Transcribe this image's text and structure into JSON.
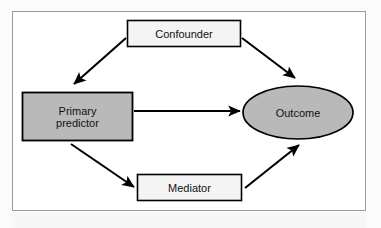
{
  "figure": {
    "type": "causal-path-diagram",
    "frame": {
      "border_color": "#9a9a9a",
      "background_color": "#ffffff"
    },
    "palette": {
      "shape_border": "#000000",
      "shaded_fill": "#b9b9b9",
      "plain_fill": "#f4f4f4",
      "arrow_color": "#000000",
      "text_color": "#111111"
    },
    "nodes": [
      {
        "id": "confounder",
        "label": "Confounder",
        "shape": "rectangle",
        "fill": "#f4f4f4"
      },
      {
        "id": "primary_predictor",
        "label": "Primary\npredictor",
        "shape": "rectangle",
        "fill": "#b9b9b9"
      },
      {
        "id": "outcome",
        "label": "Outcome",
        "shape": "ellipse",
        "fill": "#b9b9b9"
      },
      {
        "id": "mediator",
        "label": "Mediator",
        "shape": "rectangle",
        "fill": "#f4f4f4"
      }
    ],
    "edges": [
      {
        "id": "confounder-to-primary-predictor",
        "from": "confounder",
        "to": "primary_predictor",
        "style": "solid-arrow"
      },
      {
        "id": "confounder-to-outcome",
        "from": "confounder",
        "to": "outcome",
        "style": "solid-arrow"
      },
      {
        "id": "primary-predictor-to-outcome",
        "from": "primary_predictor",
        "to": "outcome",
        "style": "solid-arrow"
      },
      {
        "id": "primary-predictor-to-mediator",
        "from": "primary_predictor",
        "to": "mediator",
        "style": "solid-arrow"
      },
      {
        "id": "mediator-to-outcome",
        "from": "mediator",
        "to": "outcome",
        "style": "solid-arrow"
      }
    ]
  }
}
